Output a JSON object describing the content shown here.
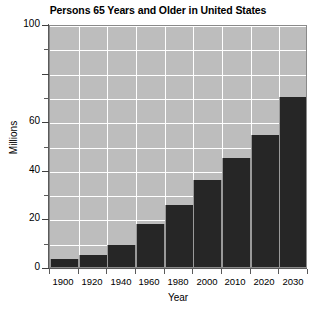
{
  "chart_data": {
    "type": "bar",
    "title": "Persons 65 Years and Older in United States",
    "xlabel": "Year",
    "ylabel": "Millions",
    "categories": [
      "1900",
      "1920",
      "1940",
      "1960",
      "1980",
      "2000",
      "2010",
      "2020",
      "2030"
    ],
    "values": [
      3.1,
      4.9,
      9.0,
      17.5,
      25.5,
      36.0,
      45.0,
      54.5,
      70.0
    ],
    "ylim": [
      0,
      100
    ],
    "y_major_ticks": [
      0,
      20,
      40,
      60,
      80,
      100
    ],
    "y_tick_labels": [
      "0",
      "20",
      "40",
      "60",
      "",
      "100"
    ],
    "y_minor_ticks": [
      10,
      30,
      50,
      70,
      90
    ],
    "grid": "horizontal-and-vertical",
    "legend": "none",
    "colors": {
      "bar": "#262626",
      "plot_background": "#bdbdbd",
      "gridline": "#ffffff",
      "axis": "#5a5a5a",
      "figure_background": "#ffffff",
      "text": "#000000"
    }
  },
  "figure": {
    "title": "Persons 65 Years and Older in United States",
    "axis_x_title": "Year",
    "axis_y_title": "Millions"
  }
}
